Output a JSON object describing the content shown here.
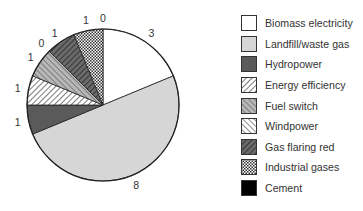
{
  "chart_data": {
    "type": "pie",
    "title": "",
    "start_angle_deg": 0,
    "direction": "clockwise",
    "slices": [
      {
        "name": "Biomass electricity",
        "value": 3,
        "label": "3",
        "fill": "#ffffff",
        "pattern": "solid"
      },
      {
        "name": "Landfill/waste gas",
        "value": 8,
        "label": "8",
        "fill": "#d6d6d6",
        "pattern": "solid"
      },
      {
        "name": "Hydropower",
        "value": 1,
        "label": "1",
        "fill": "#5a5a5a",
        "pattern": "solid"
      },
      {
        "name": "Energy efficiency",
        "value": 1,
        "label": "1",
        "fill": "#ffffff",
        "pattern": "diag-forward"
      },
      {
        "name": "Fuel switch",
        "value": 1,
        "label": "1",
        "fill": "#b8b8b8",
        "pattern": "diag-back"
      },
      {
        "name": "Windpower",
        "value": 0,
        "label": "0",
        "fill": "#ffffff",
        "pattern": "diag-back"
      },
      {
        "name": "Gas flaring red",
        "value": 1,
        "label": "1",
        "fill": "#4a4a4a",
        "pattern": "diag-forward-dark"
      },
      {
        "name": "Industrial gases",
        "value": 1,
        "label": "1",
        "fill": "#ffffff",
        "pattern": "checker"
      },
      {
        "name": "Cement",
        "value": 0,
        "label": "0",
        "fill": "#000000",
        "pattern": "solid"
      }
    ],
    "legend": {
      "position": "right",
      "entries": [
        "Biomass electricity",
        "Landfill/waste gas",
        "Hydropower",
        "Energy efficiency",
        "Fuel switch",
        "Windpower",
        "Gas flaring red",
        "Industrial gases",
        "Cement"
      ]
    }
  }
}
